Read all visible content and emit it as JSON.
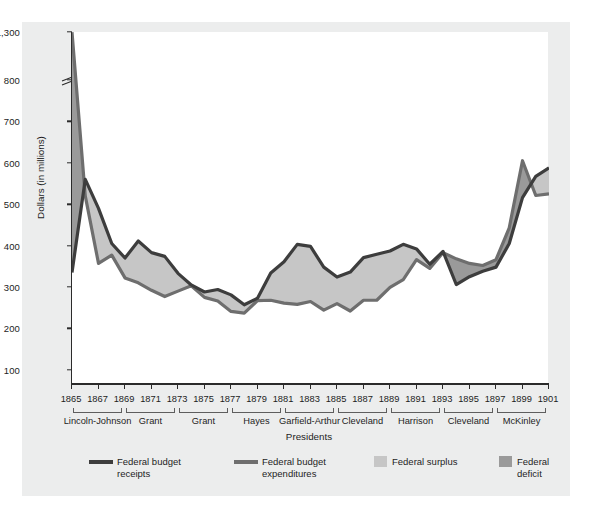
{
  "chart_data": {
    "type": "area",
    "title": "",
    "xlabel": "Presidents",
    "ylabel": "Dollars (in millions)",
    "x": [
      1865,
      1866,
      1867,
      1868,
      1869,
      1870,
      1871,
      1872,
      1873,
      1874,
      1875,
      1876,
      1877,
      1878,
      1879,
      1880,
      1881,
      1882,
      1883,
      1884,
      1885,
      1886,
      1887,
      1888,
      1889,
      1890,
      1891,
      1892,
      1893,
      1894,
      1895,
      1896,
      1897,
      1898,
      1899,
      1900,
      1901
    ],
    "ylim": [
      0,
      800
    ],
    "y_ticks": [
      "100",
      "200",
      "300",
      "400",
      "500",
      "600",
      "700",
      "800",
      "1,300"
    ],
    "y_tick_values": [
      100,
      200,
      300,
      400,
      500,
      600,
      700,
      800,
      1300
    ],
    "axis_break": true,
    "axis_break_between": [
      800,
      1300
    ],
    "x_tick_labels": [
      "1865",
      "1867",
      "1869",
      "1871",
      "1873",
      "1875",
      "1877",
      "1879",
      "1881",
      "1883",
      "1885",
      "1887",
      "1889",
      "1891",
      "1893",
      "1895",
      "1897",
      "1899",
      "1901"
    ],
    "grid": false,
    "legend_position": "bottom",
    "series": [
      {
        "name": "Federal budget receipts",
        "color": "#4a4a4a",
        "values": [
          335,
          560,
          490,
          405,
          370,
          411,
          383,
          374,
          333,
          305,
          288,
          294,
          281,
          257,
          273,
          334,
          361,
          403,
          398,
          348,
          324,
          336,
          371,
          379,
          387,
          403,
          392,
          355,
          386,
          306,
          325,
          338,
          348,
          405,
          516,
          567,
          588
        ]
      },
      {
        "name": "Federal budget expenditures",
        "color": "#4a4a4a",
        "values": [
          1298,
          520,
          357,
          377,
          322,
          310,
          292,
          277,
          290,
          303,
          275,
          266,
          241,
          237,
          267,
          268,
          261,
          258,
          265,
          244,
          260,
          242,
          268,
          268,
          299,
          318,
          366,
          345,
          383,
          368,
          357,
          352,
          366,
          443,
          605,
          521,
          525
        ]
      }
    ],
    "fills": [
      {
        "name": "Federal surplus",
        "color": "#b7b7b7",
        "description": "area where receipts exceed expenditures"
      },
      {
        "name": "Federal deficit",
        "color": "#9a9a9a",
        "description": "area where expenditures exceed receipts"
      }
    ],
    "presidents": [
      {
        "label": "Lincoln-Johnson",
        "start": 1865,
        "end": 1869
      },
      {
        "label": "Grant",
        "start": 1869,
        "end": 1873
      },
      {
        "label": "Grant",
        "start": 1873,
        "end": 1877
      },
      {
        "label": "Hayes",
        "start": 1877,
        "end": 1881
      },
      {
        "label": "Garfield-Arthur",
        "start": 1881,
        "end": 1885
      },
      {
        "label": "Cleveland",
        "start": 1885,
        "end": 1889
      },
      {
        "label": "Harrison",
        "start": 1889,
        "end": 1893
      },
      {
        "label": "Cleveland",
        "start": 1893,
        "end": 1897
      },
      {
        "label": "McKinley",
        "start": 1897,
        "end": 1901
      }
    ]
  },
  "legend": {
    "items": [
      {
        "label": "Federal budget\nreceipts",
        "type": "line",
        "color": "#3d3d3d"
      },
      {
        "label": "Federal budget\nexpenditures",
        "type": "line",
        "color": "#6e6e6e"
      },
      {
        "label": "Federal surplus",
        "type": "box",
        "color": "#c6c6c6"
      },
      {
        "label": "Federal deficit",
        "type": "box",
        "color": "#9a9a9a"
      }
    ]
  },
  "axes": {
    "y_label": "Dollars (in millions)",
    "x_label": "Presidents"
  },
  "colors": {
    "panel_bg": "#eceded",
    "plot_bg": "#ffffff",
    "axis": "#2b2b2b",
    "line_receipts": "#3d3d3d",
    "line_expenditures": "#6e6e6e",
    "fill_surplus": "#c6c6c6",
    "fill_deficit": "#9a9a9a"
  }
}
